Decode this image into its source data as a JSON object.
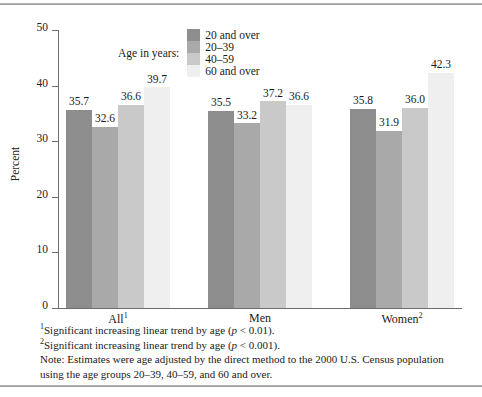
{
  "chart_data": {
    "type": "bar",
    "title": "",
    "xlabel": "",
    "ylabel": "Percent",
    "ylim": [
      0,
      50
    ],
    "yticks": [
      0,
      10,
      20,
      30,
      40,
      50
    ],
    "grid": false,
    "legend_position": "top",
    "legend_title": "Age in years:",
    "categories": [
      "All",
      "Men",
      "Women"
    ],
    "category_labels": [
      "All",
      "Men",
      "Women"
    ],
    "category_footnote_marks": [
      "1",
      "2",
      ""
    ],
    "series": [
      {
        "name": "20 and over",
        "color": "#8d8d8d",
        "values": [
          35.7,
          35.5,
          35.8
        ]
      },
      {
        "name": "20–39",
        "color": "#a9a9a9",
        "values": [
          32.6,
          33.2,
          31.9
        ]
      },
      {
        "name": "40–59",
        "color": "#c9c9c9",
        "values": [
          36.6,
          37.2,
          36.0
        ]
      },
      {
        "name": "60 and over",
        "color": "#efefef",
        "values": [
          39.7,
          36.6,
          42.3
        ]
      }
    ],
    "value_labels": {
      "All": [
        "35.7",
        "32.6",
        "36.6",
        "39.7"
      ],
      "Men": [
        "35.5",
        "33.2",
        "37.2",
        "36.6"
      ],
      "Women": [
        "35.8",
        "31.9",
        "36.0",
        "42.3"
      ]
    }
  },
  "axis": {
    "y_label": "Percent",
    "y_tick_labels": [
      "50",
      "40",
      "30",
      "20",
      "10",
      "0"
    ]
  },
  "legend": {
    "title": "Age in years:",
    "items": [
      {
        "label": "20 and over",
        "color": "#8d8d8d"
      },
      {
        "label": "20–39",
        "color": "#a9a9a9"
      },
      {
        "label": "40–59",
        "color": "#c9c9c9"
      },
      {
        "label": "60 and over",
        "color": "#efefef"
      }
    ]
  },
  "categories": [
    {
      "label": "All",
      "mark": "1"
    },
    {
      "label": "Men",
      "mark": ""
    },
    {
      "label": "Women",
      "mark": "2"
    }
  ],
  "footnotes": {
    "one_mark": "1",
    "one_text_a": "Significant increasing linear trend by age (",
    "one_italic": "p",
    "one_text_b": " < 0.01).",
    "two_mark": "2",
    "two_text_a": "Significant increasing linear trend by age (",
    "two_italic": "p",
    "two_text_b": " < 0.001).",
    "note": "Note: Estimates were age adjusted by the direct method to the 2000 U.S. Census population using the age groups 20–39, 40–59, and 60 and over."
  }
}
